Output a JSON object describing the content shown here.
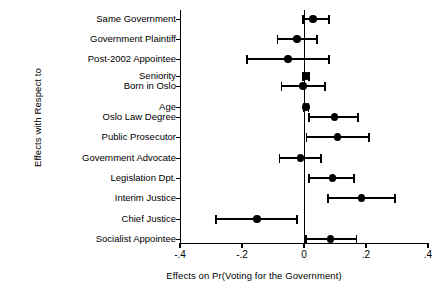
{
  "chart_data": {
    "type": "scatter",
    "title": "",
    "xlabel": "Effects on Pr(Voting for the Government)",
    "ylabel": "Effects with Respect to",
    "xlim": [
      -0.4,
      0.4
    ],
    "xticks": [
      -0.4,
      -0.2,
      0,
      0.2,
      0.4
    ],
    "xticklabels": [
      "-.4",
      "-.2",
      "0",
      ".2",
      ".4"
    ],
    "grid": false,
    "legend": null,
    "zero_reference_line": 0,
    "categories": [
      "Same Government",
      "Government Plaintiff",
      "Post-2002 Appointee",
      "Seniority",
      "Born in Oslo",
      "Age",
      "Oslo Law Degree",
      "Public Prosecutor",
      "Government Advocate",
      "Legislation Dpt.",
      "Interim Justice",
      "Chief Justice",
      "Socialist Appointee"
    ],
    "estimates": [
      0.029,
      -0.023,
      -0.052,
      0.006,
      -0.003,
      0.006,
      0.099,
      0.108,
      -0.012,
      0.092,
      0.185,
      -0.152,
      0.085
    ],
    "ci_low": [
      -0.003,
      -0.086,
      -0.183,
      -0.004,
      -0.073,
      -0.001,
      0.016,
      0.008,
      -0.079,
      0.016,
      0.078,
      -0.283,
      0.006
    ],
    "ci_high": [
      0.08,
      0.042,
      0.08,
      0.016,
      0.067,
      0.014,
      0.175,
      0.209,
      0.054,
      0.161,
      0.293,
      -0.023,
      0.169
    ],
    "marker_color": "#000000",
    "line_color": "#000000"
  }
}
